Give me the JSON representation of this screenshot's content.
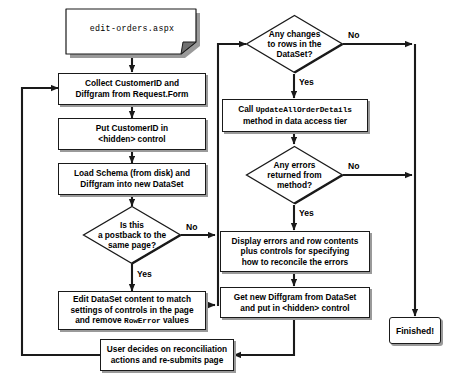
{
  "diagram": {
    "nodes": {
      "doc_page": {
        "label": "edit-orders.aspx",
        "shape": "document"
      },
      "collect": {
        "line1": "Collect CustomerID and",
        "line2": "Diffgram from Request.Form",
        "shape": "process"
      },
      "put_hidden": {
        "line1": "Put CustomerID in",
        "line2": "<hidden> control",
        "shape": "process"
      },
      "load_schema": {
        "line1": "Load Schema (from disk) and",
        "line2": "Diffgram into new DataSet",
        "shape": "process"
      },
      "is_postback": {
        "line1": "Is this",
        "line2": "a postback to the",
        "line3": "same page?",
        "shape": "decision"
      },
      "edit_dataset": {
        "line1": "Edit DataSet content to match",
        "line2": "settings of controls in the page",
        "line3_pre": "and remove ",
        "line3_mono": "RowError",
        "line3_post": " values",
        "shape": "process"
      },
      "any_changes": {
        "line1": "Any changes",
        "line2": "to rows in the",
        "line3": "DataSet?",
        "shape": "decision"
      },
      "call_update": {
        "line1_pre": "Call ",
        "line1_mono": "UpdateAllOrderDetails",
        "line2": "method in data access tier",
        "shape": "process"
      },
      "any_errors": {
        "line1": "Any errors",
        "line2": "returned from",
        "line3": "method?",
        "shape": "decision"
      },
      "display_errors": {
        "line1": "Display errors and row contents",
        "line2": "plus controls for specifying",
        "line3": "how to reconcile the errors",
        "shape": "process"
      },
      "get_diffgram": {
        "line1": "Get new Diffgram from DataSet",
        "line2": "and put in <hidden> control",
        "shape": "process"
      },
      "user_decides": {
        "line1": "User decides on reconciliation",
        "line2": "actions and re-submits page",
        "shape": "process"
      },
      "finished": {
        "label": "Finished!",
        "shape": "terminator"
      }
    },
    "edge_labels": {
      "postback_no": "No",
      "postback_yes": "Yes",
      "changes_no": "No",
      "changes_yes": "Yes",
      "errors_no": "No",
      "errors_yes": "Yes"
    },
    "colors": {
      "stroke": "#1a1a1a",
      "shadow": "#9a9a9a",
      "background": "#ffffff",
      "text": "#000000"
    }
  }
}
